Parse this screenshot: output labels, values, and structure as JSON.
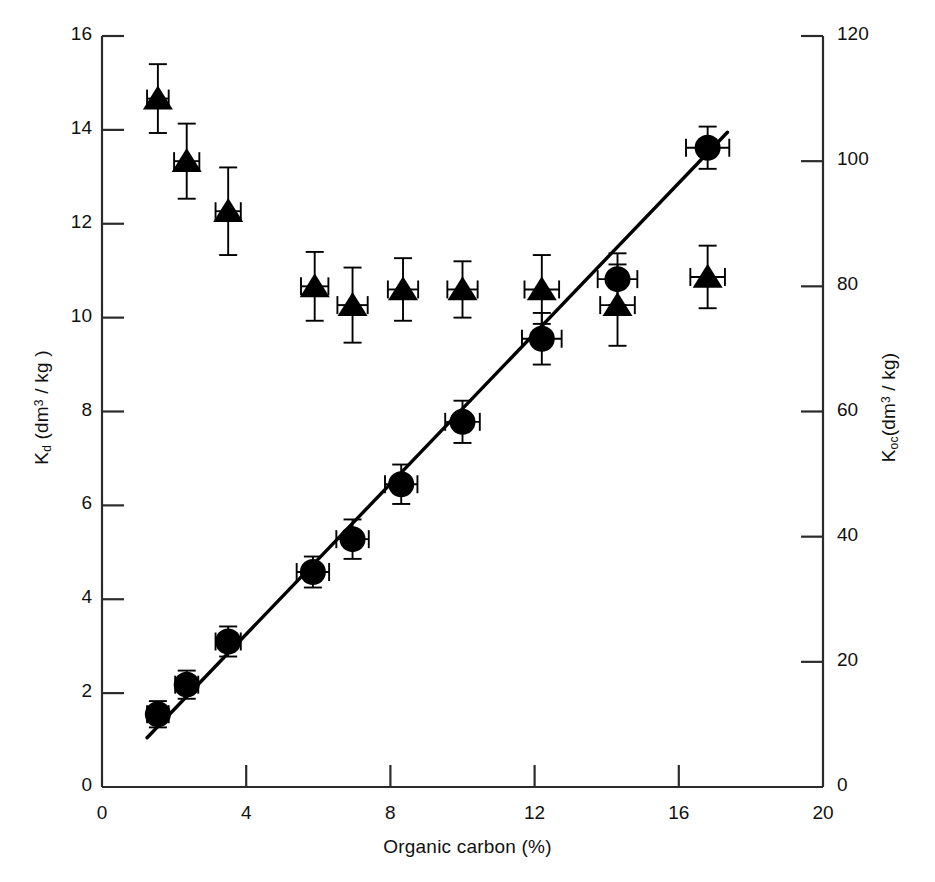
{
  "chart_data": {
    "type": "scatter",
    "title": "",
    "xlabel": "Organic carbon (%)",
    "ylabel": "K_d (dm3 / kg)",
    "y2label": "K_oc (dm3 / kg)",
    "xlim": [
      0,
      20
    ],
    "ylim": [
      0,
      16
    ],
    "y2lim": [
      0,
      120
    ],
    "xticks": [
      0,
      4,
      8,
      12,
      16,
      20
    ],
    "yticks": [
      0,
      2,
      4,
      6,
      8,
      10,
      12,
      14,
      16
    ],
    "y2ticks": [
      0,
      20,
      40,
      60,
      80,
      100,
      120
    ],
    "grid": false,
    "legend": "none",
    "axis_labels": {
      "x_title_text": "Organic carbon (%)",
      "y_left_k": "K",
      "y_left_sub": "d",
      "y_left_rest_a": " (dm",
      "y_left_sup": "3",
      "y_left_rest_b": " / kg )",
      "y_right_k": "K",
      "y_right_sub": "oc",
      "y_right_rest_a": "(dm",
      "y_right_sup": "3",
      "y_right_rest_b": " / kg)"
    },
    "series": [
      {
        "name": "Kd",
        "axis": "left",
        "marker": "circle",
        "marker_color": "#000000",
        "points": [
          {
            "x": 1.55,
            "y": 1.55,
            "xerr": 0.3,
            "yerr": 0.28
          },
          {
            "x": 2.35,
            "y": 2.18,
            "xerr": 0.32,
            "yerr": 0.3
          },
          {
            "x": 3.5,
            "y": 3.1,
            "xerr": 0.35,
            "yerr": 0.32
          },
          {
            "x": 5.85,
            "y": 4.58,
            "xerr": 0.45,
            "yerr": 0.33
          },
          {
            "x": 6.95,
            "y": 5.28,
            "xerr": 0.45,
            "yerr": 0.42
          },
          {
            "x": 8.3,
            "y": 6.45,
            "xerr": 0.45,
            "yerr": 0.42
          },
          {
            "x": 10.0,
            "y": 7.78,
            "xerr": 0.48,
            "yerr": 0.45
          },
          {
            "x": 12.2,
            "y": 9.55,
            "xerr": 0.55,
            "yerr": 0.55
          },
          {
            "x": 14.3,
            "y": 10.82,
            "xerr": 0.55,
            "yerr": 0.55
          },
          {
            "x": 16.8,
            "y": 13.62,
            "xerr": 0.6,
            "yerr": 0.45
          }
        ]
      },
      {
        "name": "Koc",
        "axis": "right",
        "marker": "triangle",
        "marker_color": "#000000",
        "points": [
          {
            "x": 1.55,
            "y": 110.0,
            "xerr": 0.3,
            "yerr": 5.5
          },
          {
            "x": 2.35,
            "y": 100.0,
            "xerr": 0.35,
            "yerr": 6.0
          },
          {
            "x": 3.5,
            "y": 92.0,
            "xerr": 0.35,
            "yerr": 7.0
          },
          {
            "x": 5.9,
            "y": 80.0,
            "xerr": 0.38,
            "yerr": 5.5
          },
          {
            "x": 6.95,
            "y": 77.0,
            "xerr": 0.42,
            "yerr": 6.0
          },
          {
            "x": 8.35,
            "y": 79.5,
            "xerr": 0.42,
            "yerr": 5.0
          },
          {
            "x": 10.0,
            "y": 79.5,
            "xerr": 0.42,
            "yerr": 4.5
          },
          {
            "x": 12.2,
            "y": 79.5,
            "xerr": 0.48,
            "yerr": 5.5
          },
          {
            "x": 14.3,
            "y": 77.0,
            "xerr": 0.48,
            "yerr": 6.5
          },
          {
            "x": 16.8,
            "y": 81.5,
            "xerr": 0.48,
            "yerr": 5.0
          }
        ]
      }
    ],
    "fit_line": {
      "name": "Kd linear fit",
      "x_start": 1.25,
      "y_start": 1.05,
      "x_end": 17.35,
      "y_end": 13.95
    }
  }
}
